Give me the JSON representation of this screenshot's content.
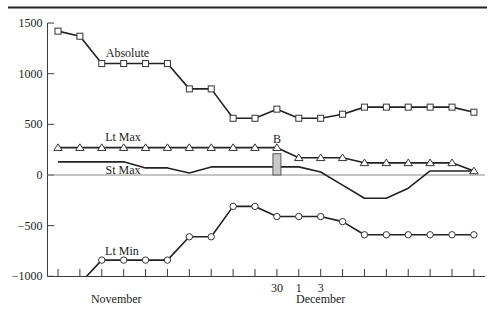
{
  "chart_data": {
    "type": "line",
    "title": "",
    "xlabel": "",
    "ylabel": "",
    "ylim": [
      -1000,
      1500
    ],
    "grid": false,
    "legend": "inline series labels",
    "yticks": [
      1500,
      1000,
      500,
      0,
      -500,
      -1000
    ],
    "ytick_labels": [
      "1500",
      "1000",
      "500",
      "0",
      "−500",
      "−1000"
    ],
    "x": [
      0,
      1,
      2,
      3,
      4,
      5,
      6,
      7,
      8,
      9,
      10,
      11,
      12,
      13,
      14,
      15,
      16,
      17,
      18,
      19
    ],
    "xtick_labels": [
      "",
      "",
      "",
      "",
      "",
      "",
      "",
      "",
      "",
      "",
      "30",
      "1",
      "3",
      "",
      "",
      "",
      "",
      "",
      "",
      ""
    ],
    "month_labels": [
      {
        "label": "November",
        "x": 2.66
      },
      {
        "label": "December",
        "x": 12.0
      }
    ],
    "series": [
      {
        "name": "Absolute",
        "marker": "square",
        "values": [
          1420,
          1370,
          1100,
          1100,
          1100,
          1100,
          850,
          850,
          560,
          560,
          650,
          560,
          560,
          600,
          670,
          670,
          670,
          670,
          670,
          620
        ],
        "label_pos": {
          "x": 3.17,
          "y": 1165
        }
      },
      {
        "name": "Lt Max",
        "marker": "triangle",
        "values": [
          270,
          270,
          270,
          270,
          270,
          270,
          270,
          270,
          270,
          270,
          270,
          170,
          170,
          170,
          120,
          120,
          120,
          120,
          120,
          40
        ],
        "label_pos": {
          "x": 2.97,
          "y": 336
        }
      },
      {
        "name": "St Max",
        "marker": "none",
        "values": [
          130,
          130,
          130,
          130,
          70,
          70,
          20,
          80,
          80,
          80,
          80,
          80,
          30,
          -100,
          -230,
          -230,
          -130,
          40,
          40,
          40
        ],
        "label_pos": {
          "x": 2.97,
          "y": 10
        }
      },
      {
        "name": "Lt Min",
        "marker": "circle",
        "values": [
          null,
          -1070,
          -840,
          -840,
          -840,
          -840,
          -610,
          -610,
          -310,
          -310,
          -410,
          -410,
          -410,
          -460,
          -590,
          -590,
          -590,
          -590,
          -590,
          -590
        ],
        "label_pos": {
          "x": 2.92,
          "y": -790
        }
      }
    ],
    "annotations": [
      {
        "type": "bar",
        "label": "B",
        "x": 10,
        "value": 210,
        "label_y": 316
      }
    ],
    "colors": {
      "line": "#222222",
      "marker_fill": "#ffffff",
      "bar_fill": "#c8c8c8",
      "zero_line": "#8a8a8a"
    }
  }
}
